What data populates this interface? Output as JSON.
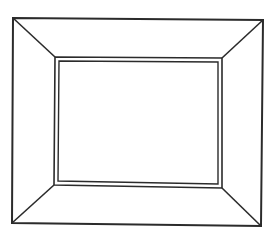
{
  "diagram": {
    "title": "",
    "colors": {
      "background": "#ffffff",
      "stroke": "#2b2b2b"
    },
    "outer_frame": {
      "top_left": [
        13,
        18
      ],
      "top_right": [
        263,
        20
      ],
      "bottom_right": [
        261,
        226
      ],
      "bottom_left": [
        12,
        223
      ],
      "stroke_width": 2
    },
    "inner_frame": {
      "top_left": [
        55,
        57
      ],
      "top_right": [
        222,
        58
      ],
      "bottom_right": [
        222,
        188
      ],
      "bottom_left": [
        54,
        185
      ],
      "stroke_width": 1.6
    },
    "inner_border": {
      "top_left": [
        59,
        61
      ],
      "top_right": [
        218,
        62
      ],
      "bottom_right": [
        218,
        184
      ],
      "bottom_left": [
        58,
        181
      ],
      "stroke_width": 1.4
    },
    "bevel_lines": [
      {
        "name": "top-left",
        "from": [
          13,
          18
        ],
        "to": [
          55,
          57
        ]
      },
      {
        "name": "top-right",
        "from": [
          263,
          20
        ],
        "to": [
          222,
          58
        ]
      },
      {
        "name": "bottom-right",
        "from": [
          261,
          226
        ],
        "to": [
          222,
          188
        ]
      },
      {
        "name": "bottom-left",
        "from": [
          12,
          223
        ],
        "to": [
          54,
          185
        ]
      }
    ]
  }
}
